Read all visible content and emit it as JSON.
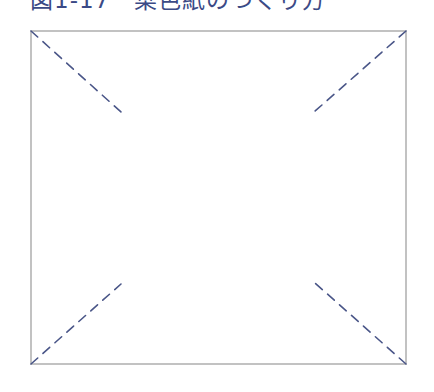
{
  "figure": {
    "title": "図1-17　菜色紙のつくり方",
    "colors": {
      "title": "#3b4a86",
      "border": "#9a9a9a",
      "dash": "#4a5688"
    },
    "square": {
      "left": 31,
      "top": 31,
      "right": 406,
      "bottom": 364
    },
    "fold_lines": [
      {
        "name": "top-left",
        "from": [
          31,
          31
        ],
        "to": [
          121,
          112
        ]
      },
      {
        "name": "top-right",
        "from": [
          406,
          31
        ],
        "to": [
          314,
          112
        ]
      },
      {
        "name": "bottom-left",
        "from": [
          31,
          364
        ],
        "to": [
          121,
          284
        ]
      },
      {
        "name": "bottom-right",
        "from": [
          406,
          364
        ],
        "to": [
          315,
          283
        ]
      }
    ]
  }
}
